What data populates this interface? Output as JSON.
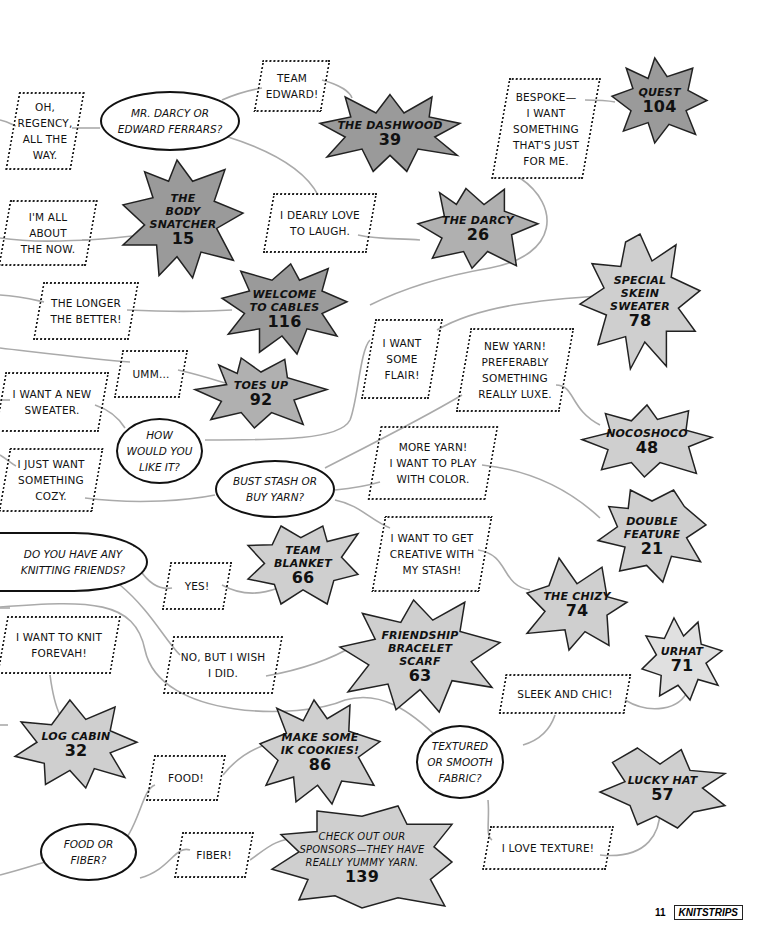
{
  "colors": {
    "dark_burst": "#9a9a9a",
    "light_burst": "#cfcfcf",
    "line": "#aaaaaa",
    "ink": "#111111"
  },
  "questions": [
    {
      "id": "q_darcy",
      "text": "MR. DARCY OR\nEDWARD FERRARS?"
    },
    {
      "id": "q_how",
      "text": "HOW\nWOULD YOU\nLIKE IT?"
    },
    {
      "id": "q_bust",
      "text": "BUST STASH OR\nBUY YARN?"
    },
    {
      "id": "q_friends",
      "text": "DO YOU HAVE ANY\nKNITTING FRIENDS?"
    },
    {
      "id": "q_texture",
      "text": "TEXTURED\nOR SMOOTH\nFABRIC?"
    },
    {
      "id": "q_food",
      "text": "FOOD OR\nFIBER?"
    }
  ],
  "answers": [
    {
      "id": "a_regency",
      "text": "OH,\nREGENCY,\nALL THE\nWAY."
    },
    {
      "id": "a_edward",
      "text": "TEAM\nEDWARD!"
    },
    {
      "id": "a_bespoke",
      "text": "BESPOKE—\nI WANT\nSOMETHING\nTHAT'S JUST\nFOR ME."
    },
    {
      "id": "a_now",
      "text": "I'M ALL\nABOUT\nTHE NOW."
    },
    {
      "id": "a_laugh",
      "text": "I DEARLY LOVE\nTO LAUGH."
    },
    {
      "id": "a_longer",
      "text": "THE LONGER\nTHE BETTER!"
    },
    {
      "id": "a_flair",
      "text": "I WANT\nSOME\nFLAIR!"
    },
    {
      "id": "a_umm",
      "text": "UMM..."
    },
    {
      "id": "a_newyarn",
      "text": "NEW YARN!\nPREFERABLY\nSOMETHING\nREALLY LUXE."
    },
    {
      "id": "a_sweater",
      "text": "I WANT A NEW\nSWEATER."
    },
    {
      "id": "a_cozy",
      "text": "I JUST WANT\nSOMETHING\nCOZY."
    },
    {
      "id": "a_color",
      "text": "MORE YARN!\nI WANT TO PLAY\nWITH COLOR."
    },
    {
      "id": "a_creative",
      "text": "I WANT TO GET\nCREATIVE WITH\nMY STASH!"
    },
    {
      "id": "a_yes",
      "text": "YES!"
    },
    {
      "id": "a_forevah",
      "text": "I WANT TO KNIT\nFOREVAH!"
    },
    {
      "id": "a_wish",
      "text": "NO, BUT I WISH\nI DID."
    },
    {
      "id": "a_sleek",
      "text": "SLEEK AND CHIC!"
    },
    {
      "id": "a_food",
      "text": "FOOD!"
    },
    {
      "id": "a_fiber",
      "text": "FIBER!"
    },
    {
      "id": "a_texture",
      "text": "I LOVE TEXTURE!"
    }
  ],
  "results": [
    {
      "id": "r_dashwood",
      "name": "THE DASHWOOD",
      "page": "39"
    },
    {
      "id": "r_quest",
      "name": "QUEST",
      "page": "104"
    },
    {
      "id": "r_body",
      "name": "THE\nBODY\nSNATCHER",
      "page": "15"
    },
    {
      "id": "r_darcy",
      "name": "THE DARCY",
      "page": "26"
    },
    {
      "id": "r_special",
      "name": "SPECIAL\nSKEIN\nSWEATER",
      "page": "78"
    },
    {
      "id": "r_cables",
      "name": "WELCOME\nTO CABLES",
      "page": "116"
    },
    {
      "id": "r_toes",
      "name": "TOES UP",
      "page": "92"
    },
    {
      "id": "r_nocoshoco",
      "name": "NOCOSHOCO",
      "page": "48"
    },
    {
      "id": "r_double",
      "name": "DOUBLE\nFEATURE",
      "page": "21"
    },
    {
      "id": "r_blanket",
      "name": "TEAM\nBLANKET",
      "page": "66"
    },
    {
      "id": "r_chizy",
      "name": "THE CHIZY",
      "page": "74"
    },
    {
      "id": "r_friendship",
      "name": "FRIENDSHIP\nBRACELET\nSCARF",
      "page": "63"
    },
    {
      "id": "r_urhat",
      "name": "URHAT",
      "page": "71"
    },
    {
      "id": "r_logcabin",
      "name": "LOG CABIN",
      "page": "32"
    },
    {
      "id": "r_cookies",
      "name": "MAKE SOME\nIK COOKIES!",
      "page": "86"
    },
    {
      "id": "r_lucky",
      "name": "LUCKY HAT",
      "page": "57"
    },
    {
      "id": "r_sponsors",
      "name": "CHECK OUT OUR\nSPONSORS—THEY HAVE\nREALLY YUMMY YARN.",
      "page": "139"
    }
  ],
  "footer": {
    "page_number": "11",
    "brand": "KNITSTRIPS"
  }
}
